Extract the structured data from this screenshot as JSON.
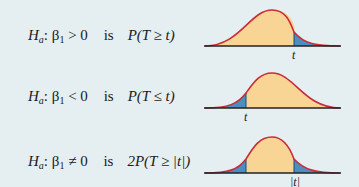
{
  "colors": {
    "background": "#e5eef0",
    "curve": "#cc2a3a",
    "body_fill": "#f8d594",
    "tail_fill": "#4a8fc0",
    "axis": "#222222"
  },
  "rows": [
    {
      "h": "H",
      "h_sub": "a",
      "beta": "β",
      "beta_sub": "1",
      "relation": " > 0",
      "is": "is",
      "prob": "P(T ≥ t)",
      "tail": "right",
      "marker_label": "t"
    },
    {
      "h": "H",
      "h_sub": "a",
      "beta": "β",
      "beta_sub": "1",
      "relation": " < 0",
      "is": "is",
      "prob": "P(T ≤ t)",
      "tail": "left",
      "marker_label": "t"
    },
    {
      "h": "H",
      "h_sub": "a",
      "beta": "β",
      "beta_sub": "1",
      "relation": " ≠ 0",
      "is": "is",
      "prob": "2P(T ≥ |t|)",
      "tail": "both",
      "marker_label": "|t|"
    }
  ]
}
